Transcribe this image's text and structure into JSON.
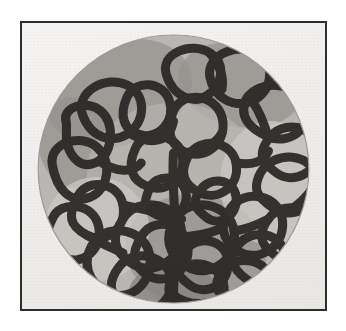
{
  "plate": {
    "medium_title": "Abstract continuous-line composition on circular field",
    "frame": {
      "border_color": "#2e2e2e",
      "border_width_px": 2,
      "paper_color": "#f2f1ef"
    },
    "page_background": "#ffffff"
  },
  "artwork": {
    "form": "circular disc",
    "disc": {
      "center_x": 150,
      "center_y": 146,
      "radius": 134,
      "base_fill": "#b9b7b3",
      "rim_color": "#9d9b97"
    },
    "palette": {
      "line_ink": "#262422",
      "line_ink_soft": "#332f2c",
      "wash_light": "#cfcdc9",
      "wash_mid": "#b4b2ae",
      "wash_dark": "#8e8c88",
      "wash_darkest": "#7a7874",
      "highlight": "#d9d7d3"
    },
    "line": {
      "style": "continuous meandering closed loops",
      "stroke_width_px": 9,
      "cap": "round",
      "join": "round",
      "count_visible_cells": 34
    },
    "wash_patches": [
      {
        "name": "upper-left-dark",
        "cx": 96,
        "cy": 70,
        "rx": 74,
        "ry": 52,
        "tone": "wash_dark",
        "rotate": -18
      },
      {
        "name": "upper-right-dark",
        "cx": 216,
        "cy": 62,
        "rx": 62,
        "ry": 42,
        "tone": "wash_dark",
        "rotate": 12
      },
      {
        "name": "left-mid-dark",
        "cx": 52,
        "cy": 120,
        "rx": 36,
        "ry": 46,
        "tone": "wash_dark",
        "rotate": -8
      },
      {
        "name": "center-mid-light",
        "cx": 150,
        "cy": 150,
        "rx": 86,
        "ry": 70,
        "tone": "wash_mid",
        "rotate": 0
      },
      {
        "name": "lower-center-dark",
        "cx": 172,
        "cy": 228,
        "rx": 70,
        "ry": 56,
        "tone": "wash_dark",
        "rotate": 8
      },
      {
        "name": "bottom-darkest",
        "cx": 150,
        "cy": 268,
        "rx": 44,
        "ry": 26,
        "tone": "wash_darkest",
        "rotate": 0
      },
      {
        "name": "right-light",
        "cx": 246,
        "cy": 160,
        "rx": 50,
        "ry": 62,
        "tone": "wash_light",
        "rotate": 0
      },
      {
        "name": "lower-left-light",
        "cx": 74,
        "cy": 206,
        "rx": 52,
        "ry": 52,
        "tone": "wash_light",
        "rotate": 0
      }
    ],
    "loops": [
      {
        "name": "loop-top-peak",
        "d": "M143 52 C136 30 168 18 186 30 C203 41 198 62 184 72 C170 82 150 74 143 52 Z"
      },
      {
        "name": "loop-upper-left-a",
        "d": "M60 92 C52 68 84 52 104 62 C124 72 122 98 106 110 C88 122 68 114 60 92 Z"
      },
      {
        "name": "loop-upper-left-b",
        "d": "M104 74 C112 56 140 58 146 78 C152 98 136 116 118 112 C100 108 96 92 104 74 Z"
      },
      {
        "name": "loop-left-bar",
        "d": "M44 100 C38 84 64 76 78 88 C92 100 90 128 76 138 C60 148 48 136 44 118 Z"
      },
      {
        "name": "loop-left-oval",
        "d": "M30 142 C26 120 58 110 74 124 C90 138 86 166 68 174 C48 182 34 166 30 142 Z"
      },
      {
        "name": "loop-upper-center",
        "d": "M150 88 C160 66 192 72 198 94 C204 118 184 136 164 130 C146 124 142 106 150 88 Z"
      },
      {
        "name": "loop-upper-right-a",
        "d": "M186 54 C182 30 218 18 236 32 C252 45 246 70 228 78 C208 86 190 74 186 54 Z"
      },
      {
        "name": "loop-upper-right-b",
        "d": "M222 76 C234 56 272 58 280 82 C288 106 264 122 244 114 C226 106 214 94 222 76 Z"
      },
      {
        "name": "loop-right-upper",
        "d": "M244 116 C258 96 290 102 292 126 C294 150 268 162 252 150 C236 138 234 130 244 116 Z"
      },
      {
        "name": "loop-right-mid",
        "d": "M236 150 C250 126 288 130 292 156 C296 182 268 198 250 186 C232 174 228 166 236 150 Z"
      },
      {
        "name": "loop-center-left-a",
        "d": "M112 126 C120 106 152 110 158 130 C164 152 146 170 126 164 C108 158 104 144 112 126 Z"
      },
      {
        "name": "loop-center-small",
        "d": "M126 166 C132 150 158 152 162 168 C166 186 150 198 134 192 C120 186 120 180 126 166 Z"
      },
      {
        "name": "loop-center-stem",
        "d": "M150 130 C148 158 152 186 152 214 C152 238 150 256 150 272"
      },
      {
        "name": "loop-center-right",
        "d": "M164 134 C176 112 208 118 212 140 C216 164 194 178 176 170 C160 162 156 150 164 134 Z"
      },
      {
        "name": "loop-mid-right-small",
        "d": "M176 168 C186 152 210 156 212 174 C214 194 194 204 182 194 C170 184 168 180 176 168 Z"
      },
      {
        "name": "loop-left-lower-a",
        "d": "M54 176 C62 154 96 158 100 182 C104 206 82 222 64 212 C46 202 46 192 54 176 Z"
      },
      {
        "name": "loop-left-lower-b",
        "d": "M30 196 C38 176 72 180 76 204 C80 228 58 244 40 234 C22 224 22 212 30 196 Z"
      },
      {
        "name": "loop-center-low-a",
        "d": "M100 196 C114 172 156 180 158 208 C160 238 128 254 108 240 C90 228 88 214 100 196 Z"
      },
      {
        "name": "loop-center-low-b",
        "d": "M118 214 C128 194 160 198 164 222 C168 248 142 264 124 252 C108 242 108 230 118 214 Z"
      },
      {
        "name": "loop-lower-left-long",
        "d": "M72 218 C86 200 120 206 126 230 C132 258 108 280 86 270 C64 260 58 238 72 218 Z"
      },
      {
        "name": "loop-bottom-left",
        "d": "M96 244 C110 224 146 232 148 258 C150 282 122 296 104 284 C86 272 84 260 96 244 Z"
      },
      {
        "name": "loop-lower-center-a",
        "d": "M152 196 C166 172 206 180 210 208 C214 238 184 256 164 244 C144 232 140 214 152 196 Z"
      },
      {
        "name": "loop-lower-center-b",
        "d": "M160 230 C172 210 202 216 204 238 C206 262 182 274 166 262 C150 250 150 244 160 230 Z"
      },
      {
        "name": "loop-lower-right-a",
        "d": "M206 186 C220 164 256 172 258 198 C260 226 232 240 214 228 C196 216 196 200 206 186 Z"
      },
      {
        "name": "loop-lower-right-b",
        "d": "M214 222 C228 204 258 210 260 232 C262 256 238 268 222 256 C206 244 206 234 214 222 Z"
      },
      {
        "name": "loop-right-bottom",
        "d": "M244 196 C258 176 290 184 290 208 C290 232 266 244 250 232 C234 220 234 210 244 196 Z"
      },
      {
        "name": "loop-bottom-center",
        "d": "M150 252 C164 232 198 240 200 264 C202 286 176 298 160 286 C144 274 142 266 150 252 Z"
      },
      {
        "name": "loop-bottom-right",
        "d": "M198 248 C212 230 244 236 246 258 C248 280 222 292 206 280 C190 268 190 260 198 248 Z"
      },
      {
        "name": "connector-a",
        "d": "M106 110 C130 124 146 118 150 98"
      },
      {
        "name": "connector-b",
        "d": "M158 130 C176 128 190 124 198 110"
      },
      {
        "name": "connector-c",
        "d": "M212 140 C228 142 238 140 244 128"
      },
      {
        "name": "connector-d",
        "d": "M76 138 C94 150 110 150 118 140"
      },
      {
        "name": "connector-e",
        "d": "M100 182 C118 186 140 190 158 196"
      },
      {
        "name": "connector-f",
        "d": "M210 208 C226 206 236 200 244 196"
      },
      {
        "name": "connector-g",
        "d": "M152 214 C166 214 182 212 196 206"
      },
      {
        "name": "connector-h",
        "d": "M64 212 C80 222 92 226 100 230"
      },
      {
        "name": "connector-i",
        "d": "M150 272 C158 278 170 282 182 280"
      },
      {
        "name": "connector-j",
        "d": "M186 30 C196 42 200 54 198 66"
      },
      {
        "name": "connector-k",
        "d": "M228 78 C236 90 240 100 244 116"
      },
      {
        "name": "connector-l",
        "d": "M292 156 C286 172 272 184 260 190"
      }
    ]
  }
}
